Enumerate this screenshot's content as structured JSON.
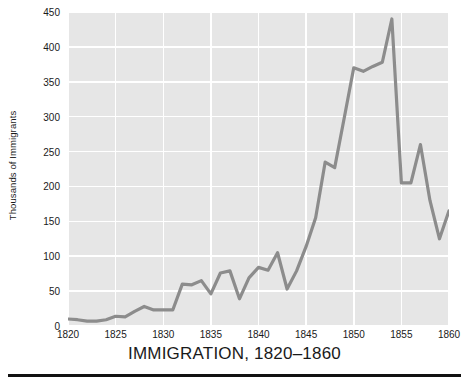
{
  "chart_data": {
    "type": "line",
    "title": "IMMIGRATION, 1820–1860",
    "xlabel": "",
    "ylabel": "Thousands of Immigrants",
    "xlim": [
      1820,
      1860
    ],
    "ylim": [
      0,
      450
    ],
    "grid": true,
    "legend": null,
    "yticks": [
      0,
      50,
      100,
      150,
      200,
      250,
      300,
      350,
      400,
      450
    ],
    "ytick_labels": [
      "0",
      "50",
      "100",
      "150",
      "200",
      "250",
      "300",
      "350",
      "400",
      "450"
    ],
    "xticks": [
      1820,
      1825,
      1830,
      1835,
      1840,
      1845,
      1850,
      1855,
      1860
    ],
    "xtick_labels": [
      "1820",
      "1825",
      "1830",
      "1835",
      "1840",
      "1845",
      "1850",
      "1855",
      "1860"
    ],
    "series": [
      {
        "name": "Immigrants",
        "color": "#8c8c8c",
        "x": [
          1820,
          1821,
          1822,
          1823,
          1824,
          1825,
          1826,
          1827,
          1828,
          1829,
          1830,
          1831,
          1832,
          1833,
          1834,
          1835,
          1836,
          1837,
          1838,
          1839,
          1840,
          1841,
          1842,
          1843,
          1844,
          1845,
          1846,
          1847,
          1848,
          1849,
          1850,
          1851,
          1852,
          1853,
          1854,
          1855,
          1856,
          1857,
          1858,
          1859,
          1860
        ],
        "values": [
          10,
          9,
          7,
          7,
          9,
          14,
          13,
          21,
          28,
          23,
          23,
          23,
          60,
          59,
          65,
          46,
          76,
          79,
          39,
          69,
          84,
          80,
          105,
          53,
          79,
          114,
          155,
          235,
          227,
          298,
          370,
          365,
          372,
          378,
          440,
          205,
          205,
          260,
          180,
          125,
          165
        ]
      }
    ]
  },
  "figure": {
    "title_text": "IMMIGRATION, 1820–1860",
    "ylabel_text": "Thousands of Immigrants",
    "plot_bg_color": "#e6e6e6",
    "grid_color": "#ffffff",
    "line_color": "#8c8c8c",
    "text_color": "#1a1a1a",
    "rule_color": "#111111"
  }
}
